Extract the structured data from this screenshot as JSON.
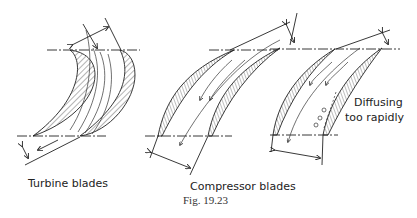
{
  "figure": {
    "caption": "Fig. 19.23",
    "panels": [
      {
        "id": "turbine",
        "label": "Turbine blades"
      },
      {
        "id": "compressor",
        "label": "Compressor blades"
      },
      {
        "id": "compressor-diffusing",
        "annotation_line1": "Diffusing",
        "annotation_line2": "too rapidly"
      }
    ]
  }
}
